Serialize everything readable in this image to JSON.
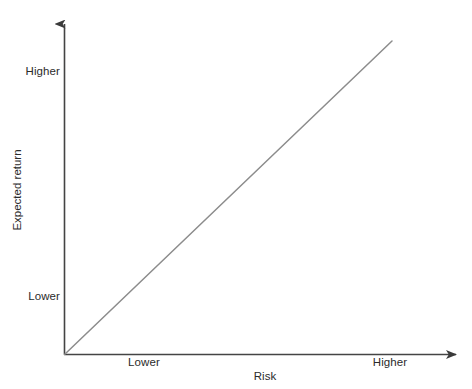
{
  "chart_data": {
    "type": "line",
    "title": "",
    "xlabel": "Risk",
    "ylabel": "Expected return",
    "x_tick_labels": [
      "Lower",
      "Higher"
    ],
    "y_tick_labels": [
      "Lower",
      "Higher"
    ],
    "xlim": [
      0,
      1
    ],
    "ylim": [
      0,
      1
    ],
    "grid": false,
    "legend": "none",
    "axis_style": "arrow-headed open axes (no box, no ticks)",
    "series": [
      {
        "name": "Risk-return tradeoff",
        "x": [
          0,
          1
        ],
        "y": [
          0,
          1
        ],
        "color": "#8c8c8c",
        "line_width": 1.5,
        "markers": "none"
      }
    ],
    "annotations": []
  },
  "axes": {
    "x_label": "Risk",
    "y_label": "Expected return",
    "x_ticks": [
      {
        "label": "Lower"
      },
      {
        "label": "Higher"
      }
    ],
    "y_ticks": [
      {
        "label": "Higher"
      },
      {
        "label": "Lower"
      }
    ]
  },
  "colors": {
    "background": "#ffffff",
    "axis": "#444444",
    "trend_line": "#8c8c8c",
    "text": "#2b2b2b"
  }
}
